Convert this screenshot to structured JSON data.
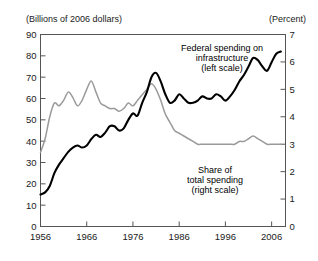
{
  "figure": {
    "unit_label_left": "(Billions of 2006 dollars)",
    "unit_label_right": "(Percent)"
  },
  "annotations": {
    "left_series": {
      "line1": "Federal spending on",
      "line2": "infrastructure",
      "line3": "(left scale)"
    },
    "right_series": {
      "line1": "Share of",
      "line2": "total spending",
      "line3": "(right scale)"
    }
  },
  "axes": {
    "left_ticks": [
      "90",
      "80",
      "70",
      "60",
      "50",
      "40",
      "30",
      "20",
      "10",
      "0"
    ],
    "right_ticks": [
      "7",
      "6",
      "5",
      "4",
      "3",
      "2",
      "1",
      "0"
    ],
    "x_ticks": [
      "1956",
      "1966",
      "1976",
      "1986",
      "1996",
      "2006"
    ]
  },
  "colors": {
    "left_series": "#000000",
    "right_series": "#9a9a9a",
    "frame": "#555555",
    "text": "#1a1a1a",
    "background": "#ffffff"
  },
  "chart_data": {
    "type": "line",
    "title": "",
    "subtitle": "",
    "xlabel": "",
    "ylabel": "(Billions of 2006 dollars)",
    "ylabel_right": "(Percent)",
    "grid": false,
    "legend": "inline-annotations",
    "xlim": [
      1956,
      2009
    ],
    "ylim": [
      0,
      90
    ],
    "ylim_right": [
      0,
      7
    ],
    "x_tick_values": [
      1956,
      1966,
      1976,
      1986,
      1996,
      2006
    ],
    "y_tick_values": [
      0,
      10,
      20,
      30,
      40,
      50,
      60,
      70,
      80,
      90
    ],
    "y_right_tick_values": [
      0,
      1,
      2,
      3,
      4,
      5,
      6,
      7
    ],
    "series": [
      {
        "name": "Federal spending on infrastructure (left scale)",
        "axis": "left",
        "units": "Billions of 2006 dollars",
        "color": "#000000",
        "x": [
          1956,
          1957,
          1958,
          1959,
          1960,
          1961,
          1962,
          1963,
          1964,
          1965,
          1966,
          1967,
          1968,
          1969,
          1970,
          1971,
          1972,
          1973,
          1974,
          1975,
          1976,
          1977,
          1978,
          1979,
          1980,
          1981,
          1982,
          1983,
          1984,
          1985,
          1986,
          1987,
          1988,
          1989,
          1990,
          1991,
          1992,
          1993,
          1994,
          1995,
          1996,
          1997,
          1998,
          1999,
          2000,
          2001,
          2002,
          2003,
          2004,
          2005,
          2006,
          2007,
          2008
        ],
        "values": [
          15,
          16,
          19,
          25,
          29,
          32,
          35,
          37,
          38,
          37,
          38,
          41,
          43,
          42,
          44,
          47,
          47,
          45,
          46,
          50,
          53,
          52,
          58,
          63,
          70,
          72,
          68,
          62,
          58,
          59,
          62,
          60,
          58,
          58,
          59,
          61,
          60,
          60,
          62,
          61,
          59,
          61,
          64,
          68,
          71,
          75,
          79,
          78,
          75,
          73,
          77,
          81,
          82
        ]
      },
      {
        "name": "Share of total spending (right scale)",
        "axis": "right",
        "units": "Percent",
        "color": "#9a9a9a",
        "x": [
          1956,
          1957,
          1958,
          1959,
          1960,
          1961,
          1962,
          1963,
          1964,
          1965,
          1966,
          1967,
          1968,
          1969,
          1970,
          1971,
          1972,
          1973,
          1974,
          1975,
          1976,
          1977,
          1978,
          1979,
          1980,
          1981,
          1982,
          1983,
          1984,
          1985,
          1986,
          1987,
          1988,
          1989,
          1990,
          1991,
          1992,
          1993,
          1994,
          1995,
          1996,
          1997,
          1998,
          1999,
          2000,
          2001,
          2002,
          2003,
          2004,
          2005,
          2006,
          2007,
          2008
        ],
        "values": [
          2.7,
          3.2,
          4.0,
          4.5,
          4.4,
          4.6,
          4.9,
          4.7,
          4.4,
          4.6,
          5.0,
          5.3,
          4.9,
          4.5,
          4.4,
          4.3,
          4.3,
          4.2,
          4.3,
          4.5,
          4.4,
          4.6,
          4.8,
          5.0,
          5.2,
          5.0,
          4.6,
          4.1,
          3.8,
          3.5,
          3.4,
          3.3,
          3.2,
          3.1,
          3.0,
          3.0,
          3.0,
          3.0,
          3.0,
          3.0,
          3.0,
          3.0,
          3.0,
          3.1,
          3.1,
          3.2,
          3.3,
          3.2,
          3.1,
          3.0,
          3.0,
          3.0,
          3.0
        ]
      }
    ]
  }
}
